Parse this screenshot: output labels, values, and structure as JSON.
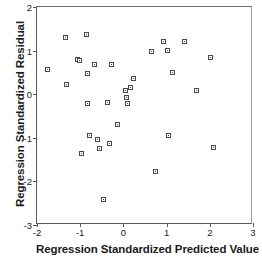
{
  "chart_data": {
    "type": "scatter",
    "title": "",
    "xlabel": "Regression Standardized Predicted Value",
    "ylabel": "Regression Standardized Residual",
    "xlim": [
      -2,
      3
    ],
    "ylim": [
      -3,
      2
    ],
    "xticks": [
      -2,
      -1,
      0,
      1,
      2,
      3
    ],
    "xtick_labels": [
      "-2",
      "-1",
      "0",
      "1",
      "2",
      "3"
    ],
    "yticks": [
      -3,
      -2,
      -1,
      0,
      1,
      2
    ],
    "ytick_labels": [
      "-3",
      "-2",
      "-1",
      "0",
      "1",
      "2"
    ],
    "grid": false,
    "legend": false,
    "marker": "open-square",
    "marker_color": "#4a4a4a",
    "series": [
      {
        "name": "residuals",
        "points": [
          [
            -1.75,
            0.57
          ],
          [
            -1.34,
            1.3
          ],
          [
            -1.32,
            0.23
          ],
          [
            -1.07,
            0.8
          ],
          [
            -1.02,
            0.78
          ],
          [
            -0.98,
            -1.36
          ],
          [
            -0.86,
            1.36
          ],
          [
            -0.84,
            0.47
          ],
          [
            -0.82,
            -0.21
          ],
          [
            -0.79,
            -0.94
          ],
          [
            -0.66,
            0.68
          ],
          [
            -0.6,
            -1.03
          ],
          [
            -0.55,
            -1.25
          ],
          [
            -0.45,
            -2.41
          ],
          [
            -0.36,
            -0.2
          ],
          [
            -0.32,
            -1.13
          ],
          [
            -0.27,
            0.67
          ],
          [
            -0.13,
            -0.7
          ],
          [
            0.06,
            0.08
          ],
          [
            0.08,
            -0.07
          ],
          [
            0.09,
            -0.22
          ],
          [
            0.17,
            0.15
          ],
          [
            0.23,
            0.36
          ],
          [
            0.66,
            0.97
          ],
          [
            0.75,
            -1.77
          ],
          [
            0.92,
            1.22
          ],
          [
            1.01,
            1.0
          ],
          [
            1.04,
            -0.94
          ],
          [
            1.14,
            0.5
          ],
          [
            1.42,
            1.2
          ],
          [
            1.69,
            0.09
          ],
          [
            2.02,
            0.85
          ],
          [
            2.09,
            -1.22
          ]
        ]
      }
    ]
  },
  "axes": {
    "x_title": "Regression Standardized Predicted Value",
    "y_title": "Regression Standardized Residual"
  }
}
